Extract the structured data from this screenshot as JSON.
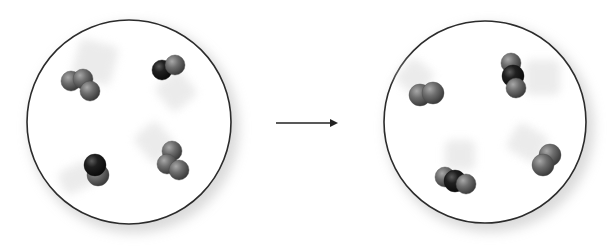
{
  "diagram": {
    "colors": {
      "background": "#ffffff",
      "container_stroke": "#2b2b2b",
      "container_shadow": "#bdbdbd",
      "atom_gray": "#6e6e6e",
      "atom_gray_light": "#a8a8a8",
      "atom_gray_dark": "#3a3a3a",
      "atom_black": "#1a1a1a",
      "atom_black_light": "#5a5a5a",
      "arrow": "#222222",
      "motion_trail": "#e3e3e3"
    },
    "arrow": {
      "direction": "right",
      "x1": 276,
      "y1": 123,
      "x2": 338,
      "y2": 123,
      "label": "reaction arrow"
    },
    "panels": [
      {
        "id": "reactants",
        "label": "Reactants",
        "container": {
          "cx": 129,
          "cy": 122,
          "r": 102
        },
        "molecules": [
          {
            "name": "triatomic-gray-molecule",
            "formula": "gray-gray-gray",
            "atoms": [
              {
                "cx": 71,
                "cy": 81,
                "r": 10,
                "type": "gray"
              },
              {
                "cx": 83,
                "cy": 79,
                "r": 10,
                "type": "gray"
              },
              {
                "cx": 90,
                "cy": 91,
                "r": 10,
                "type": "gray"
              }
            ],
            "trail": {
              "x": 75,
              "y": 42,
              "w": 40,
              "h": 40,
              "angle": 15
            }
          },
          {
            "name": "diatomic-black-gray-molecule",
            "formula": "black-gray",
            "atoms": [
              {
                "cx": 162,
                "cy": 70,
                "r": 10,
                "type": "black"
              },
              {
                "cx": 175,
                "cy": 65,
                "r": 10,
                "type": "gray"
              }
            ],
            "trail": {
              "x": 160,
              "y": 75,
              "w": 32,
              "h": 32,
              "angle": -40
            }
          },
          {
            "name": "diatomic-black-gray-molecule",
            "formula": "black-gray",
            "atoms": [
              {
                "cx": 98,
                "cy": 175,
                "r": 11,
                "type": "gray"
              },
              {
                "cx": 95,
                "cy": 165,
                "r": 11,
                "type": "black"
              }
            ],
            "trail": {
              "x": 60,
              "y": 165,
              "w": 35,
              "h": 25,
              "angle": -25
            }
          },
          {
            "name": "triatomic-gray-molecule",
            "formula": "gray-gray-gray",
            "atoms": [
              {
                "cx": 172,
                "cy": 151,
                "r": 10,
                "type": "gray"
              },
              {
                "cx": 167,
                "cy": 164,
                "r": 10,
                "type": "gray"
              },
              {
                "cx": 179,
                "cy": 170,
                "r": 10,
                "type": "gray"
              }
            ],
            "trail": {
              "x": 140,
              "y": 125,
              "w": 30,
              "h": 35,
              "angle": -40
            }
          }
        ]
      },
      {
        "id": "products",
        "label": "Products",
        "container": {
          "cx": 485,
          "cy": 122,
          "r": 101
        },
        "molecules": [
          {
            "name": "diatomic-gray-molecule",
            "formula": "gray-gray",
            "atoms": [
              {
                "cx": 420,
                "cy": 95,
                "r": 11,
                "type": "gray"
              },
              {
                "cx": 433,
                "cy": 93,
                "r": 11,
                "type": "gray"
              }
            ],
            "trail": {
              "x": 400,
              "y": 62,
              "w": 30,
              "h": 30,
              "angle": 40
            }
          },
          {
            "name": "triatomic-gray-black-gray-molecule",
            "formula": "gray-black-gray",
            "atoms": [
              {
                "cx": 511,
                "cy": 63,
                "r": 10,
                "type": "gray"
              },
              {
                "cx": 513,
                "cy": 76,
                "r": 11,
                "type": "black"
              },
              {
                "cx": 516,
                "cy": 88,
                "r": 10,
                "type": "gray"
              }
            ],
            "trail": {
              "x": 525,
              "y": 60,
              "w": 35,
              "h": 35,
              "angle": 0
            }
          },
          {
            "name": "triatomic-gray-black-gray-molecule",
            "formula": "gray-black-gray",
            "atoms": [
              {
                "cx": 445,
                "cy": 177,
                "r": 10,
                "type": "gray"
              },
              {
                "cx": 455,
                "cy": 181,
                "r": 11,
                "type": "black"
              },
              {
                "cx": 466,
                "cy": 184,
                "r": 10,
                "type": "gray"
              }
            ],
            "trail": {
              "x": 445,
              "y": 140,
              "w": 30,
              "h": 30,
              "angle": 0
            }
          },
          {
            "name": "diatomic-gray-molecule",
            "formula": "gray-gray",
            "atoms": [
              {
                "cx": 550,
                "cy": 155,
                "r": 11,
                "type": "gray"
              },
              {
                "cx": 543,
                "cy": 165,
                "r": 11,
                "type": "gray"
              }
            ],
            "trail": {
              "x": 510,
              "y": 128,
              "w": 35,
              "h": 30,
              "angle": 30
            }
          }
        ]
      }
    ]
  }
}
